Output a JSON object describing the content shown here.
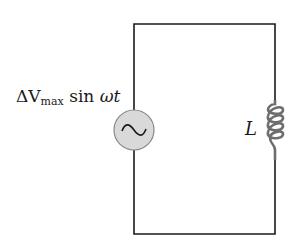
{
  "diagram": {
    "type": "AC circuit with inductor",
    "source": {
      "label_prefix": "ΔV",
      "label_sub": "max",
      "label_func": " sin ",
      "label_arg": "ωt",
      "symbol": "~",
      "fill": "#d9d9d9"
    },
    "inductor": {
      "label": "L",
      "coil_color": "#707070"
    },
    "wire_color": "#1a1a1a"
  }
}
